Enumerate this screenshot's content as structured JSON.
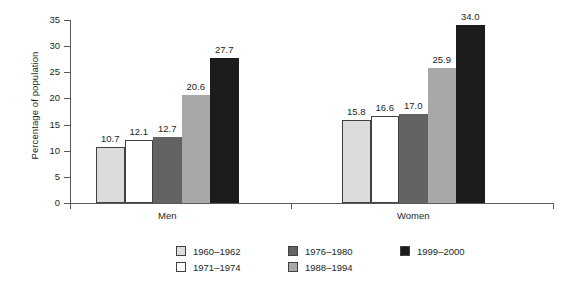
{
  "chart_data": {
    "type": "bar",
    "title": "",
    "xlabel": "",
    "ylabel": "Percentage of population",
    "ylim": [
      0,
      35
    ],
    "yticks": [
      0,
      5,
      10,
      15,
      20,
      25,
      30,
      35
    ],
    "grid": false,
    "legend_position": "bottom",
    "categories": [
      "Men",
      "Women"
    ],
    "series": [
      {
        "name": "1960–1962",
        "color": "#dcdcdc",
        "values": [
          10.7,
          15.8
        ],
        "labels": [
          "10.7",
          "15.8"
        ]
      },
      {
        "name": "1971–1974",
        "color": "#ffffff",
        "values": [
          12.1,
          16.6
        ],
        "labels": [
          "12.1",
          "16.6"
        ]
      },
      {
        "name": "1976–1980",
        "color": "#636363",
        "values": [
          12.7,
          17.0
        ],
        "labels": [
          "12.7",
          "17.0"
        ]
      },
      {
        "name": "1988–1994",
        "color": "#a8a8a8",
        "values": [
          20.6,
          25.9
        ],
        "labels": [
          "20.6",
          "25.9"
        ]
      },
      {
        "name": "1999–2000",
        "color": "#1c1c1c",
        "values": [
          27.7,
          34.0
        ],
        "labels": [
          "27.7",
          "34.0"
        ]
      }
    ]
  },
  "axis": {
    "y_title": "Percentage of population",
    "y_tick_labels": [
      "35",
      "30",
      "25",
      "20",
      "15",
      "10",
      "5",
      "0"
    ],
    "x_labels": [
      "Men",
      "Women"
    ]
  },
  "legend": {
    "entries": [
      {
        "label": "1960–1962",
        "color": "#dcdcdc"
      },
      {
        "label": "1971–1974",
        "color": "#ffffff"
      },
      {
        "label": "1976–1980",
        "color": "#636363"
      },
      {
        "label": "1988–1994",
        "color": "#a8a8a8"
      },
      {
        "label": "1999–2000",
        "color": "#1c1c1c"
      }
    ]
  },
  "bars": [
    {
      "group": "Men",
      "series": "1960–1962",
      "value": 10.7,
      "label": "10.7",
      "color": "#dcdcdc"
    },
    {
      "group": "Men",
      "series": "1971–1974",
      "value": 12.1,
      "label": "12.1",
      "color": "#ffffff"
    },
    {
      "group": "Men",
      "series": "1976–1980",
      "value": 12.7,
      "label": "12.7",
      "color": "#636363"
    },
    {
      "group": "Men",
      "series": "1988–1994",
      "value": 20.6,
      "label": "20.6",
      "color": "#a8a8a8"
    },
    {
      "group": "Men",
      "series": "1999–2000",
      "value": 27.7,
      "label": "27.7",
      "color": "#1c1c1c"
    },
    {
      "group": "Women",
      "series": "1960–1962",
      "value": 15.8,
      "label": "15.8",
      "color": "#dcdcdc"
    },
    {
      "group": "Women",
      "series": "1971–1974",
      "value": 16.6,
      "label": "16.6",
      "color": "#ffffff"
    },
    {
      "group": "Women",
      "series": "1976–1980",
      "value": 17.0,
      "label": "17.0",
      "color": "#636363"
    },
    {
      "group": "Women",
      "series": "1988–1994",
      "value": 25.9,
      "label": "25.9",
      "color": "#a8a8a8"
    },
    {
      "group": "Women",
      "series": "1999–2000",
      "value": 34.0,
      "label": "34.0",
      "color": "#1c1c1c"
    }
  ]
}
